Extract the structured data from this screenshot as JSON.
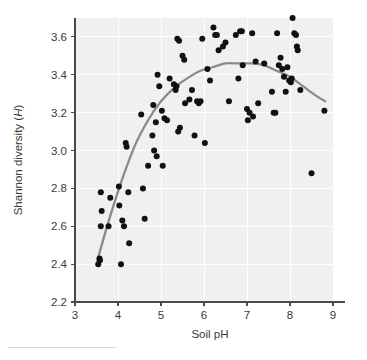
{
  "chart_data": {
    "type": "scatter",
    "title": "",
    "xlabel": "Soil pH",
    "ylabel": "Shannon diversity (H)",
    "ylabel_main": "Shannon diversity (",
    "ylabel_italic": "H",
    "ylabel_close": ")",
    "xlim": [
      3,
      9
    ],
    "ylim": [
      2.2,
      3.7
    ],
    "xticks": [
      3,
      4,
      5,
      6,
      7,
      8,
      9
    ],
    "xtick_labels": [
      "3",
      "4",
      "5",
      "6",
      "7",
      "8",
      "9"
    ],
    "yticks": [
      2.2,
      2.4,
      2.6,
      2.8,
      3.0,
      3.2,
      3.4,
      3.6
    ],
    "ytick_labels": [
      "2.2",
      "2.4",
      "2.6",
      "2.8",
      "3.0",
      "3.2",
      "3.4",
      "3.6"
    ],
    "grid": true,
    "grid_color": "#ffffff",
    "panel_background": "#f0f0f0",
    "point_color": "#111111",
    "point_radius": 3.0,
    "trend_color": "#8a8a8a",
    "trend_label": "quadratic fit",
    "legend": "none",
    "points": [
      [
        3.54,
        2.4
      ],
      [
        3.57,
        2.43
      ],
      [
        3.58,
        2.42
      ],
      [
        3.6,
        2.78
      ],
      [
        3.62,
        2.68
      ],
      [
        3.6,
        2.6
      ],
      [
        3.78,
        2.6
      ],
      [
        3.82,
        2.75
      ],
      [
        4.02,
        2.81
      ],
      [
        4.03,
        2.71
      ],
      [
        4.07,
        2.4
      ],
      [
        4.1,
        2.63
      ],
      [
        4.14,
        2.6
      ],
      [
        4.18,
        3.04
      ],
      [
        4.2,
        3.02
      ],
      [
        4.24,
        2.78
      ],
      [
        4.26,
        2.51
      ],
      [
        4.54,
        3.19
      ],
      [
        4.58,
        2.8
      ],
      [
        4.62,
        2.64
      ],
      [
        4.7,
        2.92
      ],
      [
        4.8,
        3.08
      ],
      [
        4.82,
        3.24
      ],
      [
        4.84,
        3.0
      ],
      [
        4.88,
        3.15
      ],
      [
        4.9,
        2.97
      ],
      [
        4.92,
        3.4
      ],
      [
        4.96,
        3.34
      ],
      [
        5.02,
        3.21
      ],
      [
        5.04,
        2.92
      ],
      [
        5.08,
        3.17
      ],
      [
        5.14,
        3.16
      ],
      [
        5.2,
        3.38
      ],
      [
        5.3,
        3.35
      ],
      [
        5.34,
        3.32
      ],
      [
        5.36,
        3.34
      ],
      [
        5.38,
        3.59
      ],
      [
        5.42,
        3.58
      ],
      [
        5.4,
        3.1
      ],
      [
        5.44,
        3.12
      ],
      [
        5.5,
        3.5
      ],
      [
        5.54,
        3.48
      ],
      [
        5.56,
        3.25
      ],
      [
        5.66,
        3.27
      ],
      [
        5.72,
        3.32
      ],
      [
        5.78,
        3.08
      ],
      [
        5.84,
        3.26
      ],
      [
        5.88,
        3.25
      ],
      [
        5.92,
        3.26
      ],
      [
        5.96,
        3.59
      ],
      [
        6.02,
        3.04
      ],
      [
        6.08,
        3.43
      ],
      [
        6.14,
        3.37
      ],
      [
        6.22,
        3.65
      ],
      [
        6.26,
        3.61
      ],
      [
        6.3,
        3.61
      ],
      [
        6.34,
        3.53
      ],
      [
        6.44,
        3.55
      ],
      [
        6.5,
        3.57
      ],
      [
        6.58,
        3.26
      ],
      [
        6.74,
        3.61
      ],
      [
        6.8,
        3.38
      ],
      [
        6.84,
        3.63
      ],
      [
        6.88,
        3.63
      ],
      [
        6.9,
        3.45
      ],
      [
        7.0,
        3.22
      ],
      [
        7.02,
        3.16
      ],
      [
        7.06,
        3.2
      ],
      [
        7.12,
        3.62
      ],
      [
        7.14,
        3.18
      ],
      [
        7.2,
        3.47
      ],
      [
        7.26,
        3.25
      ],
      [
        7.4,
        3.46
      ],
      [
        7.58,
        3.31
      ],
      [
        7.62,
        3.2
      ],
      [
        7.66,
        3.2
      ],
      [
        7.7,
        3.62
      ],
      [
        7.74,
        3.45
      ],
      [
        7.78,
        3.49
      ],
      [
        7.82,
        3.43
      ],
      [
        7.86,
        3.39
      ],
      [
        7.9,
        3.31
      ],
      [
        7.94,
        3.44
      ],
      [
        7.98,
        3.37
      ],
      [
        8.02,
        3.36
      ],
      [
        8.04,
        3.38
      ],
      [
        8.06,
        3.7
      ],
      [
        8.1,
        3.62
      ],
      [
        8.14,
        3.61
      ],
      [
        8.16,
        3.55
      ],
      [
        8.18,
        3.53
      ],
      [
        8.24,
        3.32
      ],
      [
        8.5,
        2.88
      ],
      [
        8.8,
        3.21
      ]
    ],
    "trend_curve": [
      [
        3.52,
        2.42
      ],
      [
        3.8,
        2.64
      ],
      [
        4.1,
        2.85
      ],
      [
        4.4,
        3.03
      ],
      [
        4.7,
        3.16
      ],
      [
        5.0,
        3.26
      ],
      [
        5.3,
        3.33
      ],
      [
        5.6,
        3.38
      ],
      [
        5.9,
        3.42
      ],
      [
        6.2,
        3.44
      ],
      [
        6.5,
        3.46
      ],
      [
        6.8,
        3.46
      ],
      [
        7.1,
        3.46
      ],
      [
        7.4,
        3.45
      ],
      [
        7.7,
        3.42
      ],
      [
        8.0,
        3.39
      ],
      [
        8.3,
        3.34
      ],
      [
        8.6,
        3.29
      ],
      [
        8.82,
        3.26
      ]
    ]
  }
}
